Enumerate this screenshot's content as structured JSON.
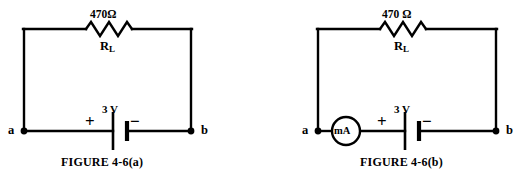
{
  "page": {
    "background_color": "#ffffff",
    "line_color": "#000000",
    "width": 513,
    "height": 179
  },
  "figures": [
    {
      "id": "a",
      "caption": "FIGURE 4-6(a)",
      "resistor": {
        "value_label": "470Ω",
        "name_label": "R",
        "name_subscript": "L"
      },
      "source": {
        "value_label": "3 V",
        "positive_sign": "+",
        "negative_sign": "−"
      },
      "nodes": {
        "left_label": "a",
        "right_label": "b"
      },
      "meter": null
    },
    {
      "id": "b",
      "caption": "FIGURE 4-6(b)",
      "resistor": {
        "value_label": "470 Ω",
        "name_label": "R",
        "name_subscript": "L"
      },
      "source": {
        "value_label": "3 V",
        "positive_sign": "+",
        "negative_sign": "−"
      },
      "nodes": {
        "left_label": "a",
        "right_label": "b"
      },
      "meter": {
        "label": "mA"
      }
    }
  ]
}
